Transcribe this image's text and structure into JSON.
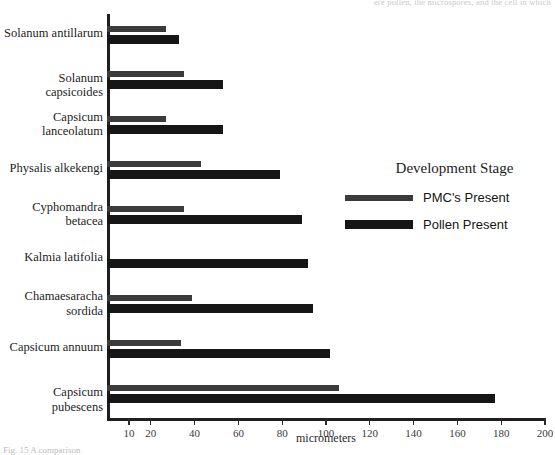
{
  "captions": {
    "top_cutoff": "ere pollen, the microspores, and the cell in which",
    "bottom_cutoff": "Fig. 15  A comparison"
  },
  "legend": {
    "title": "Development Stage",
    "entries": [
      {
        "label": "PMC's Present",
        "color": "#3b3b3b",
        "key": "pmc"
      },
      {
        "label": "Pollen Present",
        "color": "#161616",
        "key": "pollen"
      }
    ]
  },
  "chart_data": {
    "type": "bar",
    "orientation": "horizontal",
    "title": "",
    "xlabel": "micrometers",
    "ylabel": "",
    "xlim": [
      0,
      200
    ],
    "grid": false,
    "legend_position": "right",
    "tick_values": [
      10,
      20,
      40,
      60,
      80,
      100,
      120,
      140,
      160,
      180,
      200
    ],
    "tick_labels": [
      "10",
      "20",
      "40",
      "60",
      "80",
      "100",
      "120",
      "140",
      "160",
      "180",
      "200"
    ],
    "categories": [
      "Solanum antillarum",
      "Solanum capsicoides",
      "Capsicum lanceolatum",
      "Physalis alkekengi",
      "Cyphomandra betacea",
      "Kalmia  latifolia",
      "Chamaesaracha sordida",
      "Capsicum annuum",
      "Capsicum pubescens"
    ],
    "category_lines": [
      [
        "Solanum antillarum"
      ],
      [
        "Solanum capsicoides"
      ],
      [
        "Capsicum",
        "lanceolatum"
      ],
      [
        "Physalis alkekengi"
      ],
      [
        "Cyphomandra",
        "betacea"
      ],
      [
        "Kalmia  latifolia"
      ],
      [
        "Chamaesaracha",
        "sordida"
      ],
      [
        "Capsicum annuum"
      ],
      [
        "Capsicum pubescens"
      ]
    ],
    "series": [
      {
        "name": "PMC's Present",
        "color": "#3b3b3b",
        "values": [
          27,
          35,
          27,
          43,
          35,
          0,
          39,
          34,
          106
        ]
      },
      {
        "name": "Pollen Present",
        "color": "#161616",
        "values": [
          33,
          53,
          53,
          79,
          89,
          92,
          94,
          102,
          177
        ]
      }
    ]
  }
}
